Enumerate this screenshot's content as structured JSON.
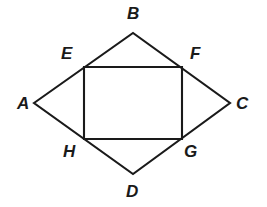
{
  "figure": {
    "type": "geometry-diagram",
    "canvas": {
      "width": 267,
      "height": 207
    },
    "background_color": "#ffffff",
    "stroke_color": "#1a1a1a",
    "stroke_width": 2.1,
    "label_color": "#1a1a1a",
    "label_style": "bold-italic",
    "label_font_size": 17,
    "shapes": [
      {
        "name": "rhombus-abcd",
        "kind": "polygon",
        "vertices": [
          "A",
          "B",
          "C",
          "D"
        ],
        "points": "34,103 133,33 230,103 133,174"
      },
      {
        "name": "rectangle-efgh",
        "kind": "polygon",
        "vertices": [
          "E",
          "F",
          "G",
          "H"
        ],
        "points": "84,67 182,67 182,139 84,139"
      }
    ],
    "points": [
      {
        "id": "A",
        "label": "A",
        "x": 34,
        "y": 103,
        "label_x": 17,
        "label_y": 95,
        "on": "rhombus-vertex-left"
      },
      {
        "id": "B",
        "label": "B",
        "x": 133,
        "y": 33,
        "label_x": 127,
        "label_y": 5,
        "on": "rhombus-vertex-top"
      },
      {
        "id": "C",
        "label": "C",
        "x": 230,
        "y": 103,
        "label_x": 236,
        "label_y": 95,
        "on": "rhombus-vertex-right"
      },
      {
        "id": "D",
        "label": "D",
        "x": 133,
        "y": 174,
        "label_x": 126,
        "label_y": 183,
        "on": "rhombus-vertex-bottom"
      },
      {
        "id": "E",
        "label": "E",
        "x": 84,
        "y": 67,
        "label_x": 61,
        "label_y": 45,
        "on": "side-AB"
      },
      {
        "id": "F",
        "label": "F",
        "x": 182,
        "y": 67,
        "label_x": 190,
        "label_y": 45,
        "on": "side-BC"
      },
      {
        "id": "G",
        "label": "G",
        "x": 182,
        "y": 139,
        "label_x": 184,
        "label_y": 143,
        "on": "side-CD"
      },
      {
        "id": "H",
        "label": "H",
        "x": 84,
        "y": 139,
        "label_x": 63,
        "label_y": 143,
        "on": "side-DA"
      }
    ]
  }
}
